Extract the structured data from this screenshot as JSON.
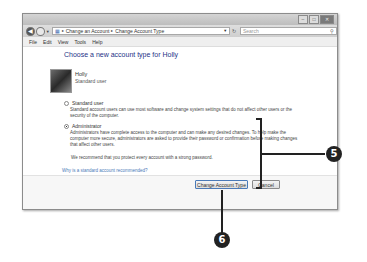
{
  "window": {
    "caption_buttons": [
      "minimize",
      "maximize",
      "close"
    ],
    "address": {
      "icon": "control-panel-icon",
      "breadcrumbs": [
        "Change an Account",
        "Change Account Type"
      ]
    },
    "search": {
      "placeholder": "Search"
    },
    "menu": [
      "File",
      "Edit",
      "View",
      "Tools",
      "Help"
    ]
  },
  "main": {
    "heading": "Choose a new account type for Holly",
    "user": {
      "name": "Holly",
      "type": "Standard user"
    },
    "options": [
      {
        "label": "Standard user",
        "selected": false,
        "description": "Standard account users can use most software and change system settings that do not affect other users or the security of the computer."
      },
      {
        "label": "Administrator",
        "selected": true,
        "description": "Administrators have complete access to the computer and can make any desired changes. To help make the computer more secure, administrators are asked to provide their password or confirmation before making changes that affect other users."
      }
    ],
    "recommendation": "We recommend that you protect every account with a strong password.",
    "help_link": "Why is a standard account recommended?",
    "buttons": {
      "primary": "Change Account Type",
      "cancel": "Cancel"
    }
  },
  "callouts": [
    {
      "number": "5"
    },
    {
      "number": "6"
    }
  ]
}
